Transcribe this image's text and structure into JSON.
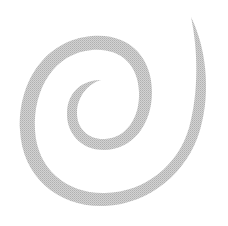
{
  "image": {
    "subject": "spiral",
    "background": "#ffffff",
    "stroke_color": "#c4c4c4",
    "shading": "halftone-gray"
  }
}
